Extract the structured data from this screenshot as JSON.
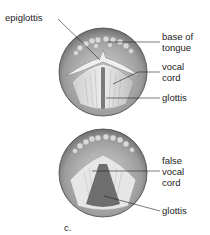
{
  "figure": {
    "panel_label": "c.",
    "top_view": {
      "labels": {
        "epiglottis": "epiglottis",
        "base_of_tongue_1": "base of",
        "base_of_tongue_2": "tongue",
        "vocal_cord_1": "vocal",
        "vocal_cord_2": "cord",
        "glottis": "glottis"
      }
    },
    "bottom_view": {
      "labels": {
        "false_vocal_cord_1": "false",
        "false_vocal_cord_2": "vocal",
        "false_vocal_cord_3": "cord",
        "glottis": "glottis"
      }
    },
    "colors": {
      "outer_ring": "#9a9a9a",
      "tongue_bumps": "#cfcfcf",
      "glottis_dark": "#6e6e6e",
      "tissue_light": "#e4e4e4"
    }
  }
}
